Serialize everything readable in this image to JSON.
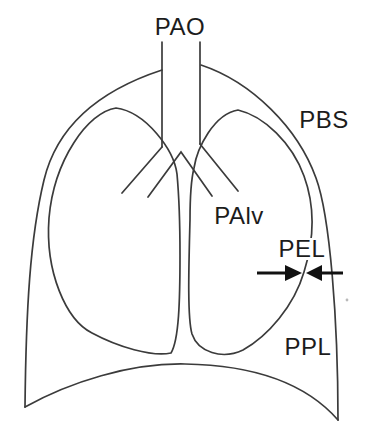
{
  "figure": {
    "type": "respiratory-pressure-diagram",
    "labels": {
      "pao": "PAO",
      "pbs": "PBS",
      "palv": "PAlv",
      "pel": "PEL",
      "ppl": "PPL"
    },
    "colors": {
      "line": "#3b3b3b",
      "text": "#1c1c1c",
      "arrow": "#111111",
      "background": "#ffffff"
    }
  }
}
